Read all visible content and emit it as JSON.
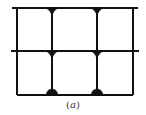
{
  "figure": {
    "caption_open": "(",
    "caption_label": "a",
    "caption_close": ")"
  },
  "diagram": {
    "type": "structural-frame",
    "stroke_color": "#111111",
    "background": "#ffffff",
    "beams": [
      {
        "name": "top-beam",
        "y": 8,
        "x1": 12,
        "x2": 138
      },
      {
        "name": "middle-beam",
        "y": 51,
        "x1": 11,
        "x2": 139
      },
      {
        "name": "bottom-beam",
        "y": 95,
        "x1": 17,
        "x2": 133
      }
    ],
    "columns": [
      {
        "name": "left-column",
        "x": 17,
        "y1": 8,
        "y2": 95
      },
      {
        "name": "inner-column-1",
        "x": 52,
        "y1": 8,
        "y2": 95
      },
      {
        "name": "inner-column-2",
        "x": 97,
        "y1": 8,
        "y2": 95
      },
      {
        "name": "right-column",
        "x": 133,
        "y1": 8,
        "y2": 95
      }
    ],
    "joints": [
      {
        "name": "joint-top-1",
        "x": 52,
        "y": 8,
        "shape": "down-fillet"
      },
      {
        "name": "joint-top-2",
        "x": 97,
        "y": 8,
        "shape": "down-fillet"
      },
      {
        "name": "joint-mid-1",
        "x": 52,
        "y": 51,
        "shape": "down-fillet"
      },
      {
        "name": "joint-mid-2",
        "x": 97,
        "y": 51,
        "shape": "down-fillet"
      },
      {
        "name": "joint-bottom-1",
        "x": 52,
        "y": 95,
        "shape": "up-dome"
      },
      {
        "name": "joint-bottom-2",
        "x": 97,
        "y": 95,
        "shape": "up-dome"
      }
    ]
  }
}
